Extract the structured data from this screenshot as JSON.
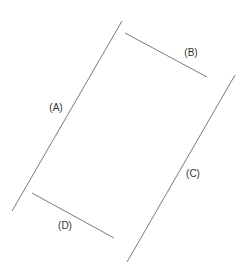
{
  "diagram": {
    "line_color": "#7a7a7a",
    "label_color": "#333333",
    "lines": [
      {
        "id": "A",
        "label": "(A)",
        "x1": 122,
        "y1": 21,
        "x2": 12,
        "y2": 211,
        "label_x": 56,
        "label_y": 107
      },
      {
        "id": "B",
        "label": "(B)",
        "x1": 125,
        "y1": 33,
        "x2": 207,
        "y2": 77,
        "label_x": 191,
        "label_y": 52
      },
      {
        "id": "C",
        "label": "(C)",
        "x1": 235,
        "y1": 75,
        "x2": 127,
        "y2": 262,
        "label_x": 193,
        "label_y": 173
      },
      {
        "id": "D",
        "label": "(D)",
        "x1": 32,
        "y1": 193,
        "x2": 114,
        "y2": 238,
        "label_x": 65,
        "label_y": 225
      }
    ]
  }
}
